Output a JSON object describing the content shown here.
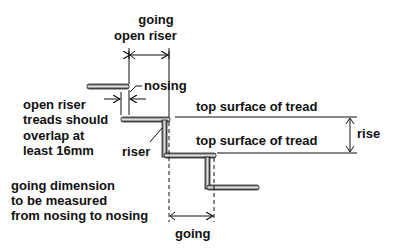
{
  "labels": {
    "going_open_riser_line1": "going",
    "going_open_riser_line2": "open riser",
    "nosing": "nosing",
    "open_riser_note": [
      "open riser",
      "treads should",
      "overlap at",
      "least 16mm"
    ],
    "top_surface_1": "top surface of tread",
    "top_surface_2": "top surface of tread",
    "rise": "rise",
    "riser": "riser",
    "going_note": [
      "going dimension",
      "to be measured",
      "from nosing to nosing"
    ],
    "going": "going"
  },
  "colors": {
    "tread_dark": "#3a3a3a",
    "tread_light": "#d8d8d8",
    "line": "#111111"
  }
}
